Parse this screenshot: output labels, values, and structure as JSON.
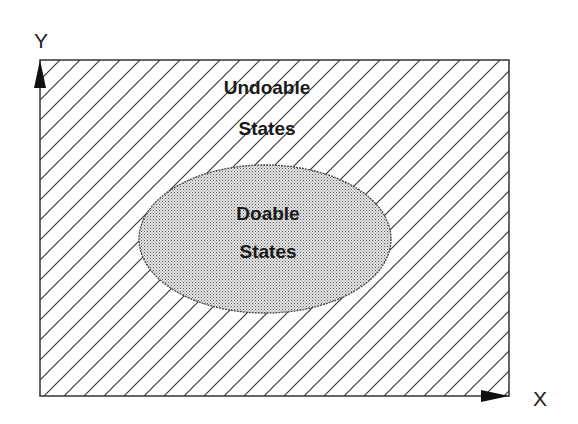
{
  "diagram": {
    "axes": {
      "y_label": "Y",
      "x_label": "X"
    },
    "outer_region": {
      "label_line1": "Undoable",
      "label_line2": "States",
      "fill": "diagonal-hatch"
    },
    "inner_region": {
      "label_line1": "Doable",
      "label_line2": "States",
      "fill": "stipple-gray",
      "shape": "ellipse"
    },
    "colors": {
      "line": "#333333",
      "stipple": "#bdbdbd",
      "background": "#ffffff"
    }
  }
}
